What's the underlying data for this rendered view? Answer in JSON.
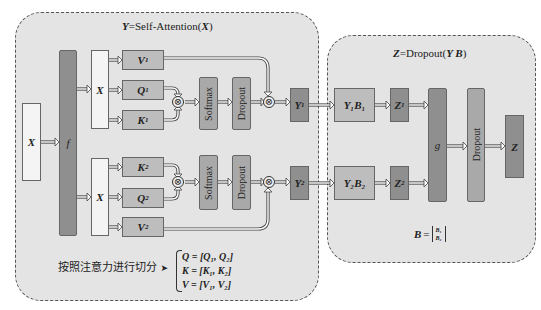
{
  "left_panel": {
    "title_var": "Y",
    "title_eq": "=Self-Attention(",
    "title_arg": "X",
    "title_close": ")",
    "input_label": "X",
    "f_label": "f",
    "split_label_top": "X",
    "split_label_bottom": "X",
    "head1": {
      "v": "V",
      "v_sub": "1",
      "q": "Q",
      "q_sub": "1",
      "k": "K",
      "k_sub": "1",
      "softmax": "Softmax",
      "dropout": "Dropout",
      "out": "Y",
      "out_sub": "1"
    },
    "head2": {
      "k": "K",
      "k_sub": "2",
      "q": "Q",
      "q_sub": "2",
      "v": "V",
      "v_sub": "2",
      "softmax": "Softmax",
      "dropout": "Dropout",
      "out": "Y",
      "out_sub": "2"
    },
    "otimes_symbol": "⊗",
    "split_note": "按照注意力进行切分",
    "split_arrow": "➤",
    "equations": [
      "Q = [Q₁, Q₂]",
      "K = [K₁, K₂]",
      "V = [V₁, V₂]"
    ]
  },
  "right_panel": {
    "title_var": "Z",
    "title_eq": "=Dropout(",
    "title_arg": "Y B",
    "title_close": ")",
    "y1b1": "Y₁B₁",
    "y2b2": "Y₂B₂",
    "z1": "Z",
    "z1_sub": "1",
    "z2": "Z",
    "z2_sub": "2",
    "g_label": "g",
    "dropout": "Dropout",
    "out": "Z",
    "b_matrix_label": "B",
    "b_matrix_eq": "=",
    "b_matrix_rows": [
      "B₁",
      "B₂"
    ]
  },
  "colors": {
    "panel_bg": "#e4e4e4",
    "panel_border": "#555555",
    "box_white": "#f4f4f4",
    "box_light": "#bdbdbd",
    "box_mid": "#a9a9a9",
    "box_dark": "#8f8f8f"
  }
}
